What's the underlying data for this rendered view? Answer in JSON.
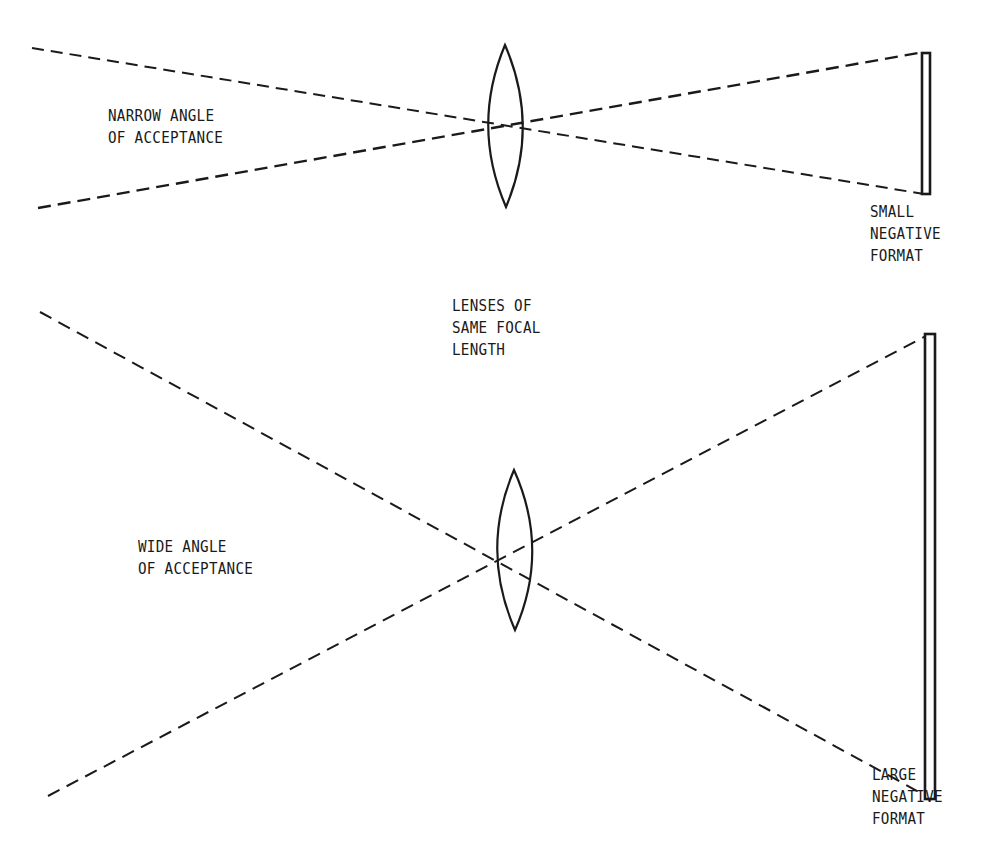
{
  "colors": {
    "background": "#ffffff",
    "ink": "#1a1a1a"
  },
  "labels": {
    "narrow_angle": {
      "lines": [
        "NARROW ANGLE",
        "OF ACCEPTANCE"
      ]
    },
    "same_focal": {
      "lines": [
        "LENSES OF",
        "SAME FOCAL",
        "LENGTH"
      ]
    },
    "wide_angle": {
      "lines": [
        "WIDE ANGLE",
        "OF ACCEPTANCE"
      ]
    },
    "small_negative": {
      "lines": [
        "SMALL",
        "NEGATIVE",
        "FORMAT"
      ]
    },
    "large_negative": {
      "lines": [
        "LARGE",
        "NEGATIVE",
        "FORMAT"
      ]
    }
  },
  "diagrams": {
    "top": {
      "name": "narrow-angle-setup",
      "lens": {
        "cx": 505,
        "top": 45,
        "bottom": 207,
        "half_width": 22
      },
      "rays": [
        {
          "x1": 32,
          "y1": 48,
          "x2": 924,
          "y2": 194
        },
        {
          "x1": 38,
          "y1": 208,
          "x2": 924,
          "y2": 52
        }
      ],
      "negative": {
        "x": 922,
        "y": 52,
        "width": 8,
        "height": 142
      }
    },
    "bottom": {
      "name": "wide-angle-setup",
      "lens": {
        "cx": 514,
        "top": 470,
        "bottom": 630,
        "half_width": 22
      },
      "rays": [
        {
          "x1": 40,
          "y1": 312,
          "x2": 930,
          "y2": 798
        },
        {
          "x1": 48,
          "y1": 796,
          "x2": 928,
          "y2": 335
        }
      ],
      "negative": {
        "x": 925,
        "y": 333,
        "width": 11,
        "height": 466
      }
    }
  }
}
